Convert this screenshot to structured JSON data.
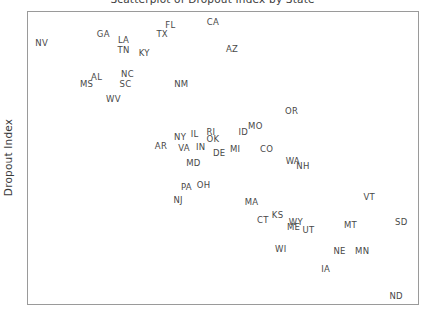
{
  "figure": {
    "title": "Scatterplot of Dropout Index by State",
    "y_axis_label": "Dropout Index",
    "frame_color": "#9a9a9a",
    "label_color": "#484848",
    "background": "#ffffff"
  },
  "chart_data": {
    "type": "scatter",
    "title": "Scatterplot of Dropout Index by State",
    "xlabel": "",
    "ylabel": "Dropout Index",
    "grid": false,
    "legend": null,
    "point_marker": "state-abbreviation-text",
    "axis_ticks": {
      "x": [],
      "y": []
    },
    "note": "Points are labelled by US state postal abbreviation; x and y are read as fractional positions within the plot frame (0-1), y increasing upward.",
    "points": [
      {
        "label": "NV",
        "x": 0.035,
        "y": 0.893
      },
      {
        "label": "GA",
        "x": 0.193,
        "y": 0.925
      },
      {
        "label": "LA",
        "x": 0.245,
        "y": 0.905
      },
      {
        "label": "TN",
        "x": 0.245,
        "y": 0.871
      },
      {
        "label": "KY",
        "x": 0.298,
        "y": 0.861
      },
      {
        "label": "FL",
        "x": 0.365,
        "y": 0.955
      },
      {
        "label": "TX",
        "x": 0.344,
        "y": 0.925
      },
      {
        "label": "CA",
        "x": 0.474,
        "y": 0.966
      },
      {
        "label": "AZ",
        "x": 0.523,
        "y": 0.874
      },
      {
        "label": "AL",
        "x": 0.176,
        "y": 0.779
      },
      {
        "label": "NC",
        "x": 0.255,
        "y": 0.786
      },
      {
        "label": "MS",
        "x": 0.15,
        "y": 0.755
      },
      {
        "label": "SC",
        "x": 0.25,
        "y": 0.755
      },
      {
        "label": "NM",
        "x": 0.393,
        "y": 0.752
      },
      {
        "label": "WV",
        "x": 0.219,
        "y": 0.701
      },
      {
        "label": "OR",
        "x": 0.676,
        "y": 0.66
      },
      {
        "label": "MO",
        "x": 0.583,
        "y": 0.609
      },
      {
        "label": "ID",
        "x": 0.552,
        "y": 0.589
      },
      {
        "label": "IL",
        "x": 0.427,
        "y": 0.582
      },
      {
        "label": "RI",
        "x": 0.469,
        "y": 0.589
      },
      {
        "label": "NY",
        "x": 0.39,
        "y": 0.572
      },
      {
        "label": "OK",
        "x": 0.474,
        "y": 0.565
      },
      {
        "label": "AR",
        "x": 0.341,
        "y": 0.541
      },
      {
        "label": "VA",
        "x": 0.4,
        "y": 0.534
      },
      {
        "label": "IN",
        "x": 0.443,
        "y": 0.538
      },
      {
        "label": "MI",
        "x": 0.531,
        "y": 0.531
      },
      {
        "label": "DE",
        "x": 0.49,
        "y": 0.517
      },
      {
        "label": "CO",
        "x": 0.612,
        "y": 0.531
      },
      {
        "label": "WA",
        "x": 0.679,
        "y": 0.49
      },
      {
        "label": "NH",
        "x": 0.705,
        "y": 0.473
      },
      {
        "label": "MD",
        "x": 0.424,
        "y": 0.483
      },
      {
        "label": "PA",
        "x": 0.406,
        "y": 0.401
      },
      {
        "label": "OH",
        "x": 0.45,
        "y": 0.408
      },
      {
        "label": "NJ",
        "x": 0.385,
        "y": 0.357
      },
      {
        "label": "MA",
        "x": 0.573,
        "y": 0.35
      },
      {
        "label": "KS",
        "x": 0.64,
        "y": 0.306
      },
      {
        "label": "CT",
        "x": 0.602,
        "y": 0.289
      },
      {
        "label": "VT",
        "x": 0.875,
        "y": 0.367
      },
      {
        "label": "WY",
        "x": 0.687,
        "y": 0.282
      },
      {
        "label": "ME",
        "x": 0.681,
        "y": 0.262
      },
      {
        "label": "UT",
        "x": 0.719,
        "y": 0.255
      },
      {
        "label": "MT",
        "x": 0.827,
        "y": 0.272
      },
      {
        "label": "SD",
        "x": 0.957,
        "y": 0.282
      },
      {
        "label": "WI",
        "x": 0.648,
        "y": 0.187
      },
      {
        "label": "NE",
        "x": 0.799,
        "y": 0.18
      },
      {
        "label": "MN",
        "x": 0.857,
        "y": 0.18
      },
      {
        "label": "IA",
        "x": 0.763,
        "y": 0.119
      },
      {
        "label": "ND",
        "x": 0.944,
        "y": 0.027
      }
    ]
  }
}
